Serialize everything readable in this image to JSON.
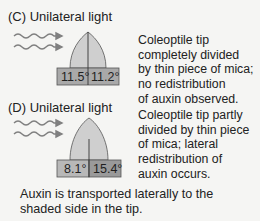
{
  "colors": {
    "background": "#f5f5f3",
    "coleoptile_fill": "#cfcfcf",
    "block_fill": "#a9a9a9",
    "block_fill_light": "#b8b8b8",
    "block_fill_dark": "#9a9a9a",
    "arrow": "#808080",
    "outline": "#555555"
  },
  "panels": [
    {
      "id": "C",
      "title": "(C)  Unilateral light",
      "description_lines": [
        "Coleoptile tip",
        "completely divided",
        "by thin piece of mica;",
        "no redistribution",
        "of auxin observed."
      ],
      "block_left_value": "11.5°",
      "block_right_value": "11.2°",
      "mica_divider": "complete"
    },
    {
      "id": "D",
      "title": "(D)  Unilateral light",
      "description_lines": [
        "Coleoptile tip partly",
        "divided by thin piece",
        "of mica; lateral",
        "redistribution of",
        "auxin occurs."
      ],
      "block_left_value": "8.1°",
      "block_right_value": "15.4°",
      "mica_divider": "partial"
    }
  ],
  "summary_lines": [
    "Auxin is transported laterally to the",
    "shaded side in the tip."
  ]
}
